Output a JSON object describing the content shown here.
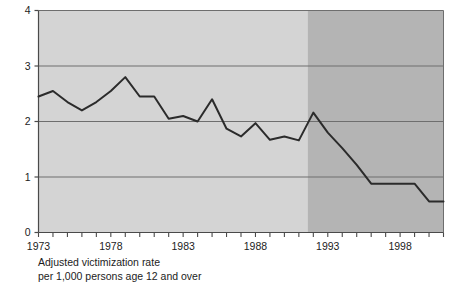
{
  "chart_data": {
    "type": "line",
    "title": "",
    "subtitle": "",
    "xlabel": "",
    "ylabel": "",
    "caption_line1": "Adjusted victimization rate",
    "caption_line2": "per 1,000 persons age 12 and over",
    "xlim": [
      1973,
      2001
    ],
    "ylim": [
      0,
      4
    ],
    "ytick_labels": [
      "0",
      "1",
      "2",
      "3",
      "4"
    ],
    "ytick_values": [
      0,
      1,
      2,
      3,
      4
    ],
    "xtick_values": [
      1973,
      1974,
      1975,
      1976,
      1977,
      1978,
      1979,
      1980,
      1981,
      1982,
      1983,
      1984,
      1985,
      1986,
      1987,
      1988,
      1989,
      1990,
      1991,
      1992,
      1993,
      1994,
      1995,
      1996,
      1997,
      1998,
      1999,
      2000,
      2001
    ],
    "xtick_labels": [
      "1973",
      "",
      "",
      "",
      "",
      "1978",
      "",
      "",
      "",
      "",
      "1983",
      "",
      "",
      "",
      "",
      "1988",
      "",
      "",
      "",
      "",
      "1993",
      "",
      "",
      "",
      "",
      "1998",
      "",
      "",
      ""
    ],
    "grid": "horizontal",
    "legend": "none",
    "x": [
      1973,
      1974,
      1975,
      1976,
      1977,
      1978,
      1979,
      1980,
      1981,
      1982,
      1983,
      1984,
      1985,
      1986,
      1987,
      1988,
      1989,
      1990,
      1991,
      1992,
      1993,
      1994,
      1995,
      1996,
      1997,
      1998,
      1999,
      2000,
      2001
    ],
    "values": [
      2.45,
      2.55,
      2.35,
      2.2,
      2.35,
      2.55,
      2.8,
      2.45,
      2.45,
      2.05,
      2.1,
      2.0,
      2.4,
      1.87,
      1.73,
      1.97,
      1.67,
      1.73,
      1.66,
      2.16,
      1.8,
      1.52,
      1.22,
      0.88,
      0.88,
      0.88,
      0.88,
      0.56,
      0.56
    ],
    "shaded_regions": [
      {
        "name": "light-region",
        "x0": 1973,
        "x1": 1991.6,
        "color": "#d4d4d4"
      },
      {
        "name": "dark-region",
        "x0": 1991.6,
        "x1": 2001,
        "color": "#b4b4b4"
      }
    ],
    "series_color": "#2b2b2b",
    "gridline_color": "#6e6e6e",
    "axis_color": "#4a4a4a"
  }
}
